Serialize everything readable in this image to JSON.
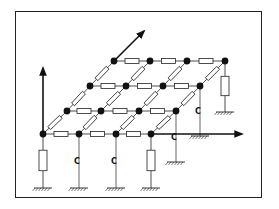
{
  "diagram": {
    "type": "3D resistor-capacitor grid network",
    "frame": {
      "left": 15,
      "top": 11,
      "right": 262,
      "bottom": 198
    },
    "colors": {
      "line": "#222222",
      "node": "#111111",
      "background": "#ffffff"
    },
    "grid_rows": [
      {
        "y": 134,
        "nodes_x": [
          43,
          79,
          116,
          151
        ]
      },
      {
        "y": 111,
        "nodes_x": [
          67,
          101,
          139,
          176
        ]
      },
      {
        "y": 86,
        "nodes_x": [
          90,
          126,
          163,
          200
        ]
      },
      {
        "y": 61,
        "nodes_x": [
          114,
          150,
          187,
          225
        ]
      }
    ],
    "axes": [
      {
        "name": "vertical-axis",
        "from": [
          43,
          134
        ],
        "to": [
          43,
          68
        ]
      },
      {
        "name": "horizontal-axis",
        "from": [
          151,
          134
        ],
        "to": [
          242,
          134
        ]
      },
      {
        "name": "depth-axis",
        "from": [
          114,
          61
        ],
        "to": [
          144,
          31
        ]
      }
    ],
    "ground_branches": [
      {
        "node": [
          43,
          134
        ],
        "element": "resistor",
        "label": "",
        "ground_y": 188
      },
      {
        "node": [
          79,
          134
        ],
        "element": "capacitor",
        "label": "C",
        "ground_y": 188
      },
      {
        "node": [
          116,
          134
        ],
        "element": "capacitor",
        "label": "C",
        "ground_y": 188
      },
      {
        "node": [
          151,
          134
        ],
        "element": "resistor",
        "label": "",
        "ground_y": 188
      },
      {
        "node": [
          176,
          111
        ],
        "element": "capacitor",
        "label": "C",
        "ground_y": 162
      },
      {
        "node": [
          200,
          86
        ],
        "element": "capacitor",
        "label": "C",
        "ground_y": 136
      },
      {
        "node": [
          225,
          61
        ],
        "element": "resistor",
        "label": "",
        "ground_y": 112
      }
    ],
    "capacitor_label": "C"
  }
}
